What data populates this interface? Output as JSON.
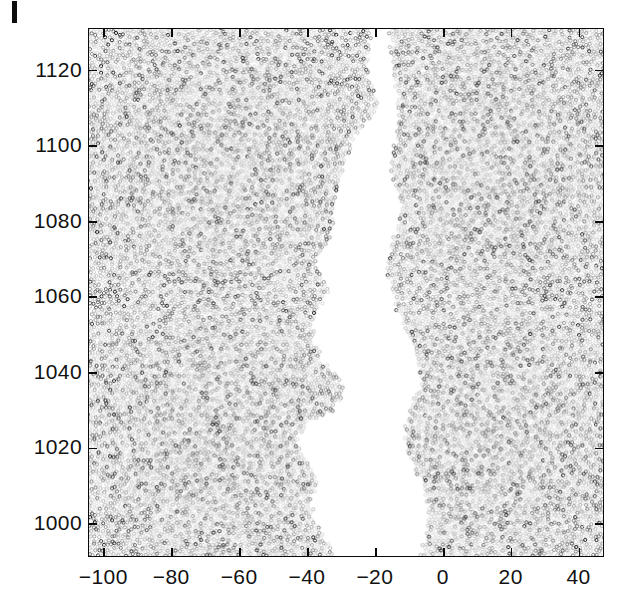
{
  "figure": {
    "panel_label": "I",
    "background_color": "#ffffff",
    "frame_color": "#0a0a0a"
  },
  "axes": {
    "x": {
      "ticks": [
        -100,
        -80,
        -60,
        -40,
        -20,
        0,
        20,
        40
      ],
      "labels": [
        "−100",
        "−80",
        "−60",
        "−40",
        "−20",
        "0",
        "20",
        "40"
      ],
      "min": -104.5,
      "max": 47.5,
      "label": ""
    },
    "y": {
      "ticks": [
        1000,
        1020,
        1040,
        1060,
        1080,
        1100,
        1120
      ],
      "labels": [
        "1000",
        "1020",
        "1040",
        "1060",
        "1080",
        "1100",
        "1120"
      ],
      "min": 991,
      "max": 1131,
      "label": ""
    }
  },
  "chart_data": {
    "type": "scatter",
    "title": "",
    "xlabel": "",
    "ylabel": "",
    "xlim": [
      -104.5,
      47.5
    ],
    "ylim": [
      991,
      1131
    ],
    "grid": false,
    "legend": null,
    "marker": {
      "shape": "circle",
      "diameter_px": 3.2,
      "fill": "none",
      "edge_colors": [
        "#d9d9d9",
        "#bdbdbd",
        "#9a9a9a",
        "#6e6e6e",
        "#3a3a3a",
        "#111111"
      ],
      "edge_color_weights": [
        0.34,
        0.27,
        0.19,
        0.11,
        0.06,
        0.03
      ]
    },
    "point_count_estimate": 20500,
    "packing": {
      "lattice": "jittered-hexagonal",
      "spacing_px": 4.05,
      "jitter_px": 1.15
    },
    "void": {
      "name": "crack",
      "fill": "#ffffff",
      "description": "Irregular vertical white channel, widest near the bottom edge",
      "outline_px": [
        [
          372,
          28
        ],
        [
          368,
          60
        ],
        [
          374,
          88
        ],
        [
          378,
          104
        ],
        [
          372,
          118
        ],
        [
          358,
          132
        ],
        [
          350,
          150
        ],
        [
          346,
          170
        ],
        [
          340,
          188
        ],
        [
          336,
          206
        ],
        [
          334,
          224
        ],
        [
          330,
          240
        ],
        [
          322,
          252
        ],
        [
          316,
          262
        ],
        [
          320,
          276
        ],
        [
          330,
          286
        ],
        [
          326,
          300
        ],
        [
          318,
          312
        ],
        [
          314,
          328
        ],
        [
          316,
          344
        ],
        [
          322,
          356
        ],
        [
          330,
          366
        ],
        [
          338,
          376
        ],
        [
          344,
          390
        ],
        [
          340,
          404
        ],
        [
          330,
          414
        ],
        [
          318,
          420
        ],
        [
          306,
          424
        ],
        [
          300,
          436
        ],
        [
          302,
          450
        ],
        [
          308,
          462
        ],
        [
          316,
          472
        ],
        [
          318,
          486
        ],
        [
          312,
          500
        ],
        [
          314,
          516
        ],
        [
          322,
          532
        ],
        [
          330,
          546
        ],
        [
          334,
          557
        ],
        [
          420,
          557
        ],
        [
          424,
          540
        ],
        [
          428,
          520
        ],
        [
          426,
          500
        ],
        [
          420,
          482
        ],
        [
          414,
          466
        ],
        [
          408,
          452
        ],
        [
          404,
          436
        ],
        [
          406,
          420
        ],
        [
          412,
          404
        ],
        [
          418,
          388
        ],
        [
          420,
          370
        ],
        [
          416,
          352
        ],
        [
          408,
          336
        ],
        [
          400,
          322
        ],
        [
          394,
          306
        ],
        [
          390,
          290
        ],
        [
          386,
          274
        ],
        [
          388,
          258
        ],
        [
          392,
          242
        ],
        [
          396,
          226
        ],
        [
          398,
          210
        ],
        [
          396,
          194
        ],
        [
          392,
          178
        ],
        [
          390,
          162
        ],
        [
          392,
          146
        ],
        [
          396,
          130
        ],
        [
          398,
          112
        ],
        [
          396,
          92
        ],
        [
          392,
          70
        ],
        [
          390,
          48
        ],
        [
          388,
          28
        ]
      ]
    }
  }
}
